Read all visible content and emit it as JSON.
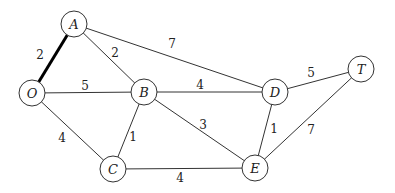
{
  "diagram": {
    "type": "weighted-undirected-graph",
    "nodes": [
      {
        "id": "A",
        "label": "A",
        "x": 74,
        "y": 24
      },
      {
        "id": "O",
        "label": "O",
        "x": 32,
        "y": 93
      },
      {
        "id": "B",
        "label": "B",
        "x": 144,
        "y": 92
      },
      {
        "id": "D",
        "label": "D",
        "x": 275,
        "y": 92
      },
      {
        "id": "T",
        "label": "T",
        "x": 361,
        "y": 69
      },
      {
        "id": "C",
        "label": "C",
        "x": 113,
        "y": 169
      },
      {
        "id": "E",
        "label": "E",
        "x": 255,
        "y": 168
      }
    ],
    "edges": [
      {
        "from": "O",
        "to": "A",
        "weight": "2",
        "highlight": true,
        "lx": 40,
        "ly": 55
      },
      {
        "from": "A",
        "to": "B",
        "weight": "2",
        "highlight": false,
        "lx": 115,
        "ly": 53
      },
      {
        "from": "A",
        "to": "D",
        "weight": "7",
        "highlight": false,
        "lx": 172,
        "ly": 44
      },
      {
        "from": "O",
        "to": "B",
        "weight": "5",
        "highlight": false,
        "lx": 85,
        "ly": 86
      },
      {
        "from": "B",
        "to": "D",
        "weight": "4",
        "highlight": false,
        "lx": 200,
        "ly": 85
      },
      {
        "from": "D",
        "to": "T",
        "weight": "5",
        "highlight": false,
        "lx": 311,
        "ly": 73
      },
      {
        "from": "B",
        "to": "C",
        "weight": "1",
        "highlight": false,
        "lx": 133,
        "ly": 137
      },
      {
        "from": "B",
        "to": "E",
        "weight": "3",
        "highlight": false,
        "lx": 203,
        "ly": 125
      },
      {
        "from": "D",
        "to": "E",
        "weight": "1",
        "highlight": false,
        "lx": 274,
        "ly": 129
      },
      {
        "from": "E",
        "to": "T",
        "weight": "7",
        "highlight": false,
        "lx": 311,
        "ly": 130
      },
      {
        "from": "O",
        "to": "C",
        "weight": "4",
        "highlight": false,
        "lx": 62,
        "ly": 138
      },
      {
        "from": "C",
        "to": "E",
        "weight": "4",
        "highlight": false,
        "lx": 180,
        "ly": 178
      }
    ],
    "node_radius": 13,
    "colors": {
      "line": "#333333",
      "highlight": "#000000",
      "background": "#ffffff"
    }
  }
}
